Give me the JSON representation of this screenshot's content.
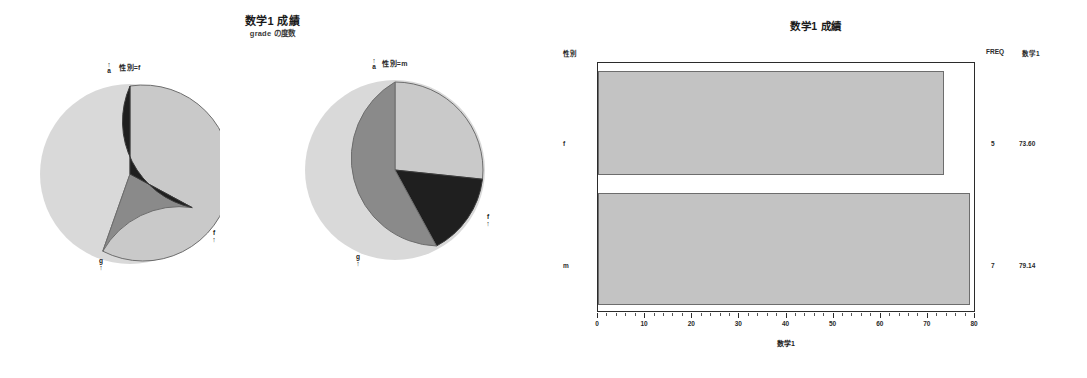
{
  "pie_panel": {
    "title": "数学1 成績",
    "subtitle": "grade の度数",
    "groups": [
      {
        "heading": "性別=f",
        "labels": {
          "a": "a",
          "f": "f",
          "g": "g"
        }
      },
      {
        "heading": "性別=m",
        "labels": {
          "a": "a",
          "f": "f",
          "g": "g"
        }
      }
    ]
  },
  "bar_panel": {
    "title": "数学1 成績",
    "y_axis_head": "性別",
    "x_axis_title": "数学1",
    "freq_head": "FREQ",
    "mean_head": "数学1",
    "categories": [
      "f",
      "m"
    ],
    "freq": [
      "5",
      "7"
    ],
    "means": [
      "73.60",
      "79.14"
    ],
    "x_tick_labels": [
      "0",
      "10",
      "20",
      "30",
      "40",
      "50",
      "60",
      "70",
      "80"
    ]
  },
  "colors": {
    "slice_light": "#c9c9c9",
    "slice_mid": "#8a8a8a",
    "slice_dark": "#1f1f1f",
    "bar_fill": "#c3c3c3",
    "axis": "#2b2b2b"
  },
  "chart_data": [
    {
      "type": "pie",
      "title": "数学1 成績",
      "subtitle": "grade の度数",
      "panel": "性別=f",
      "legend_position": "slice-labels",
      "categories": [
        "a",
        "g",
        "f"
      ],
      "values": [
        60,
        20,
        20
      ],
      "slice_colors": [
        "#c9c9c9",
        "#8a8a8a",
        "#1f1f1f"
      ]
    },
    {
      "type": "pie",
      "title": "数学1 成績",
      "subtitle": "grade の度数",
      "panel": "性別=m",
      "legend_position": "slice-labels",
      "categories": [
        "a",
        "g",
        "f"
      ],
      "values": [
        43,
        43,
        14
      ],
      "slice_colors": [
        "#c9c9c9",
        "#8a8a8a",
        "#1f1f1f"
      ]
    },
    {
      "type": "bar",
      "orientation": "horizontal",
      "title": "数学1 成績",
      "categories": [
        "f",
        "m"
      ],
      "values": [
        73.6,
        79.14
      ],
      "freq": [
        5,
        7
      ],
      "xlabel": "数学1",
      "ylabel": "性別",
      "xlim": [
        0,
        80
      ],
      "xticks": [
        0,
        10,
        20,
        30,
        40,
        50,
        60,
        70,
        80
      ],
      "grid": false,
      "bar_color": "#c3c3c3"
    }
  ]
}
